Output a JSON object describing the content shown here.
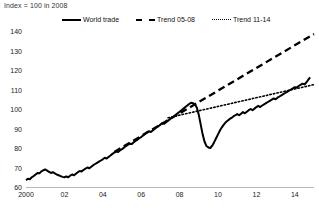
{
  "subtitle": "Index = 100 in 2008",
  "legend": [
    {
      "label": "World trade",
      "style": "solid",
      "color": "#000000"
    },
    {
      "label": "Trend 05-08",
      "style": "dashed",
      "color": "#000000"
    },
    {
      "label": "Trend 11-14",
      "style": "dotted",
      "color": "#000000"
    }
  ],
  "chart_data": {
    "type": "line",
    "title": "",
    "subtitle": "Index = 100 in 2008",
    "xlabel": "",
    "ylabel": "",
    "xlim": [
      2000,
      2015
    ],
    "ylim": [
      60,
      140
    ],
    "yticks": [
      60,
      70,
      80,
      90,
      100,
      110,
      120,
      130,
      140
    ],
    "ytick_labels": [
      "60",
      "70",
      "80",
      "90",
      "100",
      "110",
      "120",
      "130",
      "140"
    ],
    "xticks": [
      2000,
      2002,
      2004,
      2006,
      2008,
      2010,
      2012,
      2014
    ],
    "xtick_labels": [
      "2000",
      "02",
      "04",
      "06",
      "08",
      "10",
      "12",
      "14"
    ],
    "grid": false,
    "legend_position": "top",
    "series": [
      {
        "name": "World trade",
        "style": "solid",
        "color": "#000000",
        "x": [
          2000.0,
          2000.1,
          2000.2,
          2000.3,
          2000.4,
          2000.5,
          2000.6,
          2000.7,
          2000.8,
          2000.9,
          2001.0,
          2001.1,
          2001.2,
          2001.3,
          2001.4,
          2001.5,
          2001.6,
          2001.7,
          2001.8,
          2001.9,
          2002.0,
          2002.1,
          2002.2,
          2002.3,
          2002.4,
          2002.5,
          2002.6,
          2002.7,
          2002.8,
          2002.9,
          2003.0,
          2003.1,
          2003.2,
          2003.3,
          2003.4,
          2003.5,
          2003.6,
          2003.7,
          2003.8,
          2003.9,
          2004.0,
          2004.1,
          2004.2,
          2004.3,
          2004.4,
          2004.5,
          2004.6,
          2004.7,
          2004.8,
          2004.9,
          2005.0,
          2005.1,
          2005.2,
          2005.3,
          2005.4,
          2005.5,
          2005.6,
          2005.7,
          2005.8,
          2005.9,
          2006.0,
          2006.1,
          2006.2,
          2006.3,
          2006.4,
          2006.5,
          2006.6,
          2006.7,
          2006.8,
          2006.9,
          2007.0,
          2007.1,
          2007.2,
          2007.3,
          2007.4,
          2007.5,
          2007.6,
          2007.7,
          2007.8,
          2007.9,
          2008.0,
          2008.1,
          2008.2,
          2008.3,
          2008.4,
          2008.5,
          2008.6,
          2008.7,
          2008.8,
          2008.9,
          2009.0,
          2009.1,
          2009.2,
          2009.3,
          2009.4,
          2009.5,
          2009.6,
          2009.7,
          2009.8,
          2009.9,
          2010.0,
          2010.1,
          2010.2,
          2010.3,
          2010.4,
          2010.5,
          2010.6,
          2010.7,
          2010.8,
          2010.9,
          2011.0,
          2011.1,
          2011.2,
          2011.3,
          2011.4,
          2011.5,
          2011.6,
          2011.7,
          2011.8,
          2011.9,
          2012.0,
          2012.1,
          2012.2,
          2012.3,
          2012.4,
          2012.5,
          2012.6,
          2012.7,
          2012.8,
          2012.9,
          2013.0,
          2013.1,
          2013.2,
          2013.3,
          2013.4,
          2013.5,
          2013.6,
          2013.7,
          2013.8,
          2013.9,
          2014.0,
          2014.1,
          2014.2,
          2014.3,
          2014.4,
          2014.5,
          2014.6,
          2014.7,
          2014.8
        ],
        "y": [
          63.5,
          64.2,
          64.0,
          65.0,
          65.6,
          66.4,
          67.2,
          67.0,
          68.0,
          68.6,
          69.0,
          68.4,
          67.8,
          67.2,
          67.6,
          67.0,
          66.4,
          66.0,
          65.6,
          65.2,
          65.0,
          65.4,
          65.0,
          65.8,
          66.4,
          66.0,
          66.8,
          67.6,
          68.2,
          68.0,
          68.8,
          69.4,
          70.0,
          69.6,
          70.4,
          71.2,
          71.8,
          72.4,
          73.0,
          73.6,
          74.2,
          75.0,
          74.6,
          75.4,
          76.2,
          77.0,
          77.6,
          78.2,
          78.0,
          78.8,
          79.4,
          80.2,
          81.0,
          81.6,
          82.2,
          82.0,
          82.8,
          83.6,
          84.2,
          85.0,
          85.6,
          86.4,
          87.2,
          88.0,
          88.6,
          88.2,
          89.0,
          89.8,
          90.6,
          91.2,
          92.0,
          92.8,
          92.4,
          93.2,
          94.0,
          94.8,
          95.6,
          96.2,
          97.0,
          97.8,
          98.6,
          99.4,
          100.2,
          101.0,
          101.8,
          102.6,
          103.2,
          103.0,
          102.4,
          100.6,
          97.0,
          92.0,
          87.0,
          83.2,
          81.0,
          80.3,
          80.0,
          81.2,
          83.0,
          85.0,
          87.0,
          89.0,
          90.6,
          92.0,
          93.2,
          94.0,
          94.8,
          95.4,
          96.2,
          96.8,
          97.4,
          96.8,
          97.6,
          98.4,
          97.8,
          98.6,
          99.4,
          100.0,
          99.4,
          100.2,
          101.0,
          101.6,
          101.0,
          101.8,
          102.4,
          103.0,
          103.6,
          104.2,
          104.8,
          105.4,
          105.0,
          105.8,
          106.4,
          107.0,
          107.6,
          108.2,
          108.8,
          109.4,
          110.0,
          110.6,
          111.2,
          111.0,
          111.8,
          112.4,
          113.0,
          112.6,
          113.6,
          115.0,
          116.2
        ]
      },
      {
        "name": "Trend 05-08",
        "style": "dashed",
        "color": "#000000",
        "x": [
          2004.6,
          2015.0
        ],
        "y": [
          78.0,
          138.5
        ]
      },
      {
        "name": "Trend 11-14",
        "style": "dotted",
        "color": "#000000",
        "x": [
          2007.4,
          2015.0
        ],
        "y": [
          95.5,
          112.5
        ]
      }
    ]
  }
}
